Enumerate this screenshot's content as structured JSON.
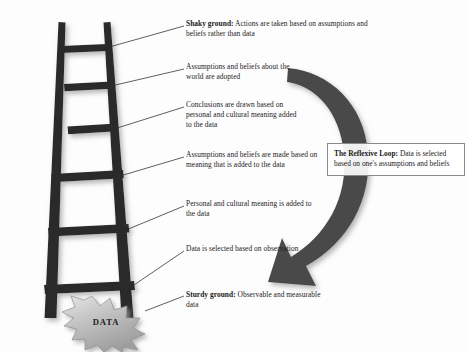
{
  "diagram": {
    "colors": {
      "background": "#fdfdfd",
      "ladder": "#2b2b2b",
      "arrow": "#4a4a4a",
      "burst_fill": "#b9b9b9",
      "burst_edge": "#8f8f8f",
      "text": "#1b1b1b",
      "leader_line": "#2b2b2b",
      "box_border": "#8a8a8a"
    },
    "rungs": [
      {
        "id": "rung-7-shaky-ground",
        "bold_lead": "Shaky ground:",
        "text": " Actions are taken based on assumptions and beliefs rather than data"
      },
      {
        "id": "rung-6-assumptions-adopted",
        "bold_lead": "",
        "text": "Assumptions and beliefs about the world are adopted"
      },
      {
        "id": "rung-5-conclusions-drawn",
        "bold_lead": "",
        "text": "Conclusions are drawn based on personal and cultural meaning added to the data"
      },
      {
        "id": "rung-4-assumptions-made",
        "bold_lead": "",
        "text": "Assumptions and beliefs are made based on meaning that is added to the data"
      },
      {
        "id": "rung-3-meaning-added",
        "bold_lead": "",
        "text": "Personal and cultural meaning is added to the data"
      },
      {
        "id": "rung-2-data-selected",
        "bold_lead": "",
        "text": "Data is selected based on observation"
      },
      {
        "id": "rung-1-sturdy-ground",
        "bold_lead": "Sturdy ground:",
        "text": " Observable and measurable data"
      }
    ],
    "reflexive_loop": {
      "bold_lead": "The Reflexive Loop:",
      "text": " Data is selected based on one's assumptions and beliefs"
    },
    "data_burst": {
      "label": "DATA"
    }
  }
}
